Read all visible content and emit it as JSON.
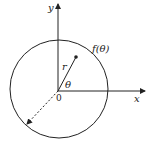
{
  "diagram": {
    "labels": {
      "y_axis": "y",
      "x_axis": "x",
      "origin": "0",
      "radius": "r",
      "angle": "θ",
      "curve": "f(θ)"
    },
    "colors": {
      "stroke": "#222222",
      "background": "#ffffff"
    }
  }
}
